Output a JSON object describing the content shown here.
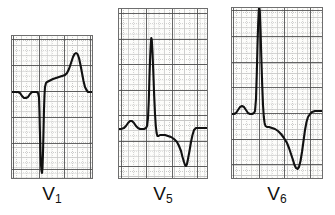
{
  "figure": {
    "kind": "ecg-strip",
    "background_color": "#ffffff",
    "paper_color": "#fdfdfb",
    "trace_color": "#111111",
    "grid_fine_color": "#9a9a9a",
    "grid_bold_color": "#4a4a4a",
    "border_color": "#6e6e6e",
    "panel_count": 3
  },
  "panels": [
    {
      "id": "v1",
      "label": "V",
      "label_sub": "1",
      "label_full": "V1",
      "x": 11,
      "y": 35,
      "width": 82,
      "height": 144,
      "grid": {
        "small_box_px": 5.1,
        "bold_every": 5,
        "bold_x_offsets": [
          2,
          28,
          53,
          79
        ],
        "bold_y_offsets": [
          4,
          30,
          56,
          82,
          108,
          134
        ],
        "baseline_y_offset": 56
      },
      "morphology": "rS / QS complex with deep S wave, elevated ST segment and tall upright T wave",
      "features": [
        "small P wave",
        "deep negative S wave",
        "ST elevation",
        "prominent T wave"
      ]
    },
    {
      "id": "v5",
      "label": "V",
      "label_sub": "5",
      "label_full": "V5",
      "x": 118,
      "y": 8,
      "width": 90,
      "height": 171,
      "grid": {
        "small_box_px": 5.1,
        "bold_every": 5,
        "bold_x_offsets": [
          3,
          28,
          54,
          79
        ],
        "bold_y_offsets": [
          5,
          31,
          56,
          82,
          107,
          133,
          158
        ],
        "baseline_y_offset": 133
      },
      "morphology": "tall R wave with deep symmetrically inverted T wave",
      "features": [
        "small P wave",
        "tall narrow R wave",
        "ST depression",
        "deep inverted T wave"
      ]
    },
    {
      "id": "v6",
      "label": "V",
      "label_sub": "6",
      "label_full": "V6",
      "x": 231,
      "y": 7,
      "width": 92,
      "height": 172,
      "grid": {
        "small_box_px": 5.1,
        "bold_every": 5,
        "bold_x_offsets": [
          2,
          28,
          53,
          79
        ],
        "bold_y_offsets": [
          3,
          29,
          55,
          80,
          106,
          132,
          157
        ],
        "baseline_y_offset": 106
      },
      "morphology": "very tall R wave reaching top of panel with deep inverted T wave",
      "features": [
        "small P wave",
        "very tall R wave",
        "ST down-sloping",
        "deep inverted T wave"
      ]
    }
  ],
  "chart_data": {
    "type": "line",
    "title": "",
    "xlabel": "",
    "ylabel": "",
    "grid": true,
    "legend_position": "below-each-panel",
    "series": [
      {
        "name": "V1",
        "panel": "v1",
        "xlim": [
          0,
          82
        ],
        "ylim": [
          144,
          0
        ],
        "points": [
          [
            0,
            57
          ],
          [
            4,
            57
          ],
          [
            7,
            57
          ],
          [
            9,
            58
          ],
          [
            11,
            61
          ],
          [
            13,
            63
          ],
          [
            15,
            63
          ],
          [
            17,
            62
          ],
          [
            19,
            59
          ],
          [
            21,
            57
          ],
          [
            23,
            57
          ],
          [
            25,
            57
          ],
          [
            26,
            57
          ],
          [
            27,
            58
          ],
          [
            28,
            62
          ],
          [
            28.5,
            78
          ],
          [
            29,
            100
          ],
          [
            29.5,
            118
          ],
          [
            30,
            130
          ],
          [
            30.5,
            136
          ],
          [
            31,
            138
          ],
          [
            31.5,
            133
          ],
          [
            32,
            118
          ],
          [
            32.5,
            96
          ],
          [
            33,
            74
          ],
          [
            33.5,
            60
          ],
          [
            34,
            52
          ],
          [
            35,
            48
          ],
          [
            36,
            47
          ],
          [
            38,
            46
          ],
          [
            40,
            45
          ],
          [
            42,
            44
          ],
          [
            45,
            43
          ],
          [
            48,
            42
          ],
          [
            51,
            41
          ],
          [
            54,
            40
          ],
          [
            56,
            38
          ],
          [
            58,
            34
          ],
          [
            60,
            28
          ],
          [
            62,
            22
          ],
          [
            63.5,
            19
          ],
          [
            65,
            18
          ],
          [
            66.5,
            19
          ],
          [
            68,
            23
          ],
          [
            69.5,
            30
          ],
          [
            71,
            38
          ],
          [
            72.5,
            46
          ],
          [
            74,
            52
          ],
          [
            75.5,
            55
          ],
          [
            77,
            57
          ],
          [
            79,
            57
          ],
          [
            82,
            57
          ]
        ]
      },
      {
        "name": "V5",
        "panel": "v5",
        "xlim": [
          0,
          90
        ],
        "ylim": [
          171,
          0
        ],
        "points": [
          [
            0,
            121
          ],
          [
            3,
            121
          ],
          [
            6,
            120
          ],
          [
            8,
            118
          ],
          [
            10,
            115
          ],
          [
            12,
            113
          ],
          [
            14,
            113
          ],
          [
            16,
            115
          ],
          [
            18,
            118
          ],
          [
            20,
            120
          ],
          [
            22,
            121
          ],
          [
            24,
            121
          ],
          [
            26,
            121
          ],
          [
            28,
            120
          ],
          [
            29,
            118
          ],
          [
            30,
            110
          ],
          [
            30.8,
            92
          ],
          [
            31.5,
            68
          ],
          [
            32.2,
            48
          ],
          [
            32.8,
            36
          ],
          [
            33.3,
            30
          ],
          [
            33.8,
            32
          ],
          [
            34.5,
            44
          ],
          [
            35.3,
            64
          ],
          [
            36.2,
            88
          ],
          [
            37,
            106
          ],
          [
            37.8,
            118
          ],
          [
            38.6,
            125
          ],
          [
            39.4,
            128
          ],
          [
            40.5,
            128
          ],
          [
            42,
            127
          ],
          [
            44,
            127
          ],
          [
            47,
            127
          ],
          [
            50,
            128
          ],
          [
            53,
            129
          ],
          [
            56,
            131
          ],
          [
            59,
            134
          ],
          [
            61,
            138
          ],
          [
            63,
            143
          ],
          [
            64.5,
            149
          ],
          [
            66,
            154
          ],
          [
            67,
            157
          ],
          [
            68,
            158
          ],
          [
            69,
            156
          ],
          [
            70,
            151
          ],
          [
            71.5,
            143
          ],
          [
            73,
            134
          ],
          [
            74.5,
            127
          ],
          [
            76,
            122
          ],
          [
            78,
            120
          ],
          [
            81,
            120
          ],
          [
            84,
            120
          ],
          [
            87,
            120
          ],
          [
            90,
            120
          ]
        ]
      },
      {
        "name": "V6",
        "panel": "v6",
        "xlim": [
          0,
          92
        ],
        "ylim": [
          172,
          0
        ],
        "points": [
          [
            0,
            107
          ],
          [
            3,
            107
          ],
          [
            5,
            106
          ],
          [
            7,
            103
          ],
          [
            9,
            100
          ],
          [
            11,
            99
          ],
          [
            13,
            100
          ],
          [
            15,
            103
          ],
          [
            17,
            106
          ],
          [
            19,
            107
          ],
          [
            21,
            107
          ],
          [
            23,
            106
          ],
          [
            24,
            104
          ],
          [
            25,
            92
          ],
          [
            25.8,
            66
          ],
          [
            26.5,
            38
          ],
          [
            27.2,
            16
          ],
          [
            27.8,
            4
          ],
          [
            28.2,
            0
          ],
          [
            28.8,
            4
          ],
          [
            29.5,
            22
          ],
          [
            30.3,
            50
          ],
          [
            31.2,
            78
          ],
          [
            32,
            98
          ],
          [
            32.8,
            110
          ],
          [
            33.6,
            116
          ],
          [
            34.5,
            119
          ],
          [
            36,
            120
          ],
          [
            38,
            120
          ],
          [
            41,
            121
          ],
          [
            44,
            122
          ],
          [
            47,
            124
          ],
          [
            50,
            127
          ],
          [
            53,
            131
          ],
          [
            56,
            136
          ],
          [
            58,
            141
          ],
          [
            60,
            147
          ],
          [
            62,
            153
          ],
          [
            63.5,
            158
          ],
          [
            65,
            161
          ],
          [
            66.5,
            162
          ],
          [
            68,
            160
          ],
          [
            69.5,
            154
          ],
          [
            71,
            145
          ],
          [
            72.5,
            134
          ],
          [
            74,
            123
          ],
          [
            75.5,
            115
          ],
          [
            77,
            110
          ],
          [
            79,
            107
          ],
          [
            81,
            105
          ],
          [
            84,
            104
          ],
          [
            88,
            104
          ],
          [
            92,
            104
          ]
        ]
      }
    ]
  }
}
